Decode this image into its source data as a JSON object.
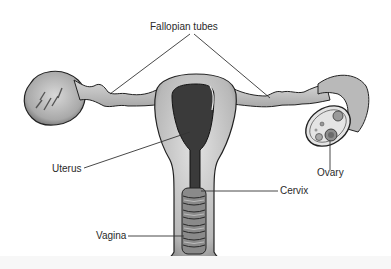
{
  "diagram": {
    "labels": {
      "fallopian_tubes": "Fallopian tubes",
      "uterus": "Uterus",
      "ovary": "Ovary",
      "cervix": "Cervix",
      "vagina": "Vagina"
    },
    "colors": {
      "tissue": "#c9c9c9",
      "tissue_dark": "#8a8a8a",
      "cavity": "#3a3a3a",
      "outline": "#222222",
      "leader_line": "#333333",
      "background": "#ffffff"
    }
  }
}
